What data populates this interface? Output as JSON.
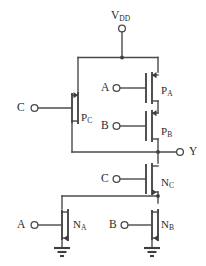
{
  "diagram": {
    "background_color": "#ffffff",
    "wire_color": "#4a4a4a",
    "device_color": "#3d3d3d",
    "text_color": "#2b2b2b"
  },
  "supply": {
    "label": "V",
    "label_sub": "DD",
    "terminal": "vdd-terminal"
  },
  "output": {
    "label": "Y",
    "terminal": "output-terminal"
  },
  "inputs": [
    {
      "name": "input-c-pmos",
      "label": "C"
    },
    {
      "name": "input-a-pmos",
      "label": "A"
    },
    {
      "name": "input-b-pmos",
      "label": "B"
    },
    {
      "name": "input-c-nmos",
      "label": "C"
    },
    {
      "name": "input-a-nmos",
      "label": "A"
    },
    {
      "name": "input-b-nmos",
      "label": "B"
    }
  ],
  "transistors": [
    {
      "name": "transistor-pc",
      "label": "P",
      "label_sub": "C",
      "type": "pmos"
    },
    {
      "name": "transistor-pa",
      "label": "P",
      "label_sub": "A",
      "type": "pmos"
    },
    {
      "name": "transistor-pb",
      "label": "P",
      "label_sub": "B",
      "type": "pmos"
    },
    {
      "name": "transistor-nc",
      "label": "N",
      "label_sub": "C",
      "type": "nmos"
    },
    {
      "name": "transistor-na",
      "label": "N",
      "label_sub": "A",
      "type": "nmos"
    },
    {
      "name": "transistor-nb",
      "label": "N",
      "label_sub": "B",
      "type": "nmos"
    }
  ],
  "grounds": [
    {
      "name": "ground-na"
    },
    {
      "name": "ground-nb"
    }
  ]
}
